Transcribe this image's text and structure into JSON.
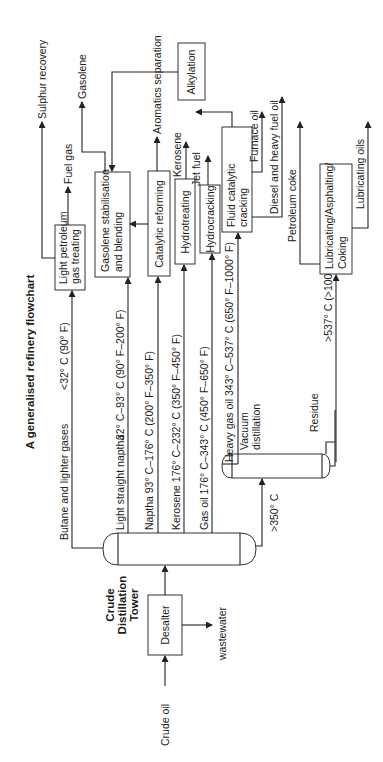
{
  "title": "A generalised refinery flowchart",
  "feed": {
    "label": "Crude oil"
  },
  "desalter": {
    "label": "Desalter",
    "outlet": "wastewater"
  },
  "crude_tower": {
    "lines": [
      "Crude",
      "Distillation",
      "Tower"
    ]
  },
  "vacuum": {
    "lines": [
      "Vacuum",
      "distillation"
    ]
  },
  "streams": {
    "butane": "Butane and lighter gases",
    "butane_temp": "<32° C (90° F)",
    "lsn": "Light straight naptha",
    "lsn_temp": "32° C–93° C (90° F–200° F)",
    "naptha": "Naptha   93° C–176° C (200° F–350° F)",
    "kerosene": "Kerosene 176° C–232° C (350° F–450° F)",
    "gasoil": "Gas oil 176° C–343° C (450° F–650° F)",
    "hgo": "Heavy gas oil 343° C–537° C (650° F–1000° F)",
    "bottoms": ">350° C",
    "residue": "Residue",
    "residue_temp": ">537° C (>1000° F)"
  },
  "units": {
    "lpg": [
      "Light petroleum",
      "gas treating"
    ],
    "gsb": [
      "Gasolene stabilisation",
      "and blending"
    ],
    "alky": [
      "Alkylation"
    ],
    "reform": [
      "Catalytic reforming"
    ],
    "hydrotreat": [
      "Hydrotreating"
    ],
    "hydrocrack": [
      "Hydrocracking"
    ],
    "fcc": [
      "Fluid catalytic",
      "cracking"
    ],
    "lube": [
      "Lubricating/Asphalting/",
      "Coking"
    ]
  },
  "products": {
    "sulphur": "Sulphur recovery",
    "fuelgas": "Fuel gas",
    "gasolene": "Gasolene",
    "aromatics": "Aromatics separation",
    "kerosene": "Kerosene",
    "jetfuel": "Jet fuel",
    "furnace": "Furnace oil",
    "diesel": "Diesel and heavy fuel oil",
    "coke": "Petroleum coke",
    "lubeoils": "Lubricating oils"
  }
}
